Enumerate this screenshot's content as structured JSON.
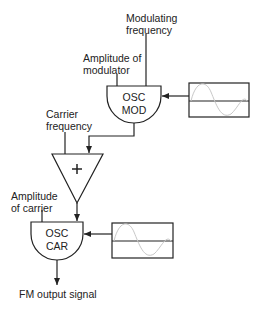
{
  "diagram": {
    "type": "FM synthesis block diagram",
    "labels": {
      "modulating_frequency": [
        "Modulating",
        "frequency"
      ],
      "amplitude_of_modulator": [
        "Amplitude of",
        "modulator"
      ],
      "carrier_frequency": [
        "Carrier",
        "frequency"
      ],
      "amplitude_of_carrier": [
        "Amplitude",
        "of carrier"
      ],
      "output": "FM output signal"
    },
    "blocks": {
      "osc_mod": [
        "OSC",
        "MOD"
      ],
      "adder": "+",
      "osc_car": [
        "OSC",
        "CAR"
      ]
    },
    "waveforms": [
      "sine-wavetable-mod",
      "sine-wavetable-car"
    ],
    "colors": {
      "stroke": "#222222",
      "wave": "#c8c8c8",
      "background": "#ffffff"
    }
  }
}
